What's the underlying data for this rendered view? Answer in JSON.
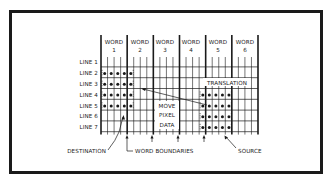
{
  "figure": {
    "words": [
      {
        "label": "WORD",
        "num": "1"
      },
      {
        "label": "WORD",
        "num": "2"
      },
      {
        "label": "WORD",
        "num": "3"
      },
      {
        "label": "WORD",
        "num": "4"
      },
      {
        "label": "WORD",
        "num": "5"
      },
      {
        "label": "WORD",
        "num": "6"
      }
    ],
    "lines": [
      "LINE 1",
      "LINE 2",
      "LINE 3",
      "LINE 4",
      "LINE 5",
      "LINE 6",
      "LINE 7"
    ],
    "labels": {
      "translation": "TRANSLATION",
      "move_1": "MOVE",
      "move_2": "PIXEL",
      "move_3": "DATA",
      "destination": "DESTINATION",
      "word_boundaries": "WORD BOUNDARIES",
      "source": "SOURCE"
    },
    "grid": {
      "pixels_per_word": 4,
      "words": 6,
      "rows": 7,
      "destination_block": {
        "rows": [
          2,
          5
        ],
        "cols": [
          1,
          5
        ]
      },
      "source_block": {
        "rows": [
          4,
          7
        ],
        "cols": [
          16,
          20
        ]
      }
    },
    "colors": {
      "ink": "#1a1a1a",
      "background": "#ffffff"
    }
  }
}
